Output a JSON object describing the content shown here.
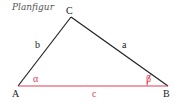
{
  "title": "Planfigur",
  "vertices": {
    "A": {
      "label": "A",
      "x": 18,
      "y": 86
    },
    "B": {
      "label": "B",
      "x": 168,
      "y": 86
    },
    "C": {
      "label": "C",
      "x": 71,
      "y": 17
    }
  },
  "sides": {
    "a": {
      "label": "a",
      "color": "#222222"
    },
    "b": {
      "label": "b",
      "color": "#222222"
    },
    "c": {
      "label": "c",
      "color": "#e0405a"
    }
  },
  "angles": {
    "alpha": {
      "label": "α",
      "color": "#e0405a"
    },
    "beta": {
      "label": "β",
      "color": "#e0405a"
    }
  },
  "colors": {
    "line": "#222222",
    "accent": "#e0405a"
  }
}
